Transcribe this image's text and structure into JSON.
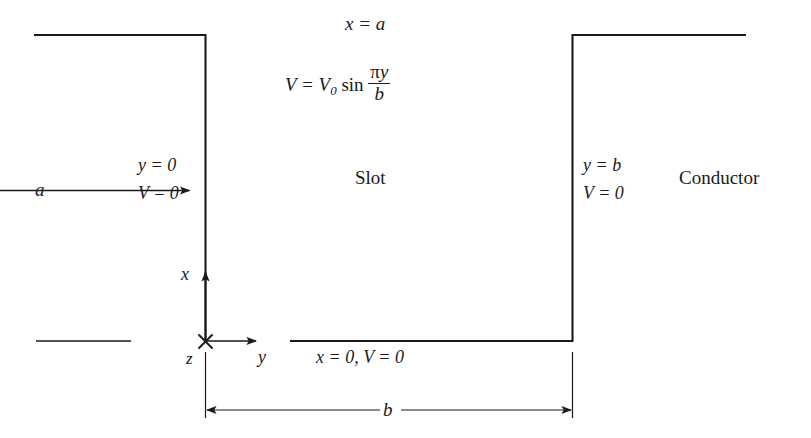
{
  "figure": {
    "title_equation": {
      "line1": "x = a",
      "line2_prefix": "V = V",
      "line2_sub": "0",
      "line2_func": "sin",
      "line2_num_pi": "π",
      "line2_num_y": "y",
      "line2_den": "b"
    },
    "region_label": "Slot",
    "exterior_label": "Conductor",
    "left_wall": {
      "line1": "y = 0",
      "line2": "V = 0"
    },
    "right_wall": {
      "line1": "y = b",
      "line2": "V = 0"
    },
    "bottom_wall": {
      "label": "x = 0, V = 0"
    },
    "axes": {
      "x_label": "x",
      "y_label": "y",
      "z_label": "z"
    },
    "dimensions": {
      "height_label": "a",
      "width_label": "b"
    },
    "colors": {
      "stroke": "#1a1a1a",
      "background": "#ffffff"
    }
  }
}
